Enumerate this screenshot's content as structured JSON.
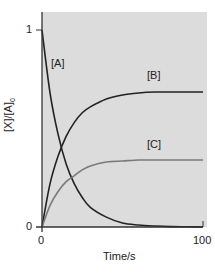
{
  "chart_data": {
    "type": "line",
    "title": "",
    "xlabel": "Time/s",
    "ylabel": "[X]/[A]0",
    "xlim": [
      0,
      100
    ],
    "ylim": [
      0,
      1.08
    ],
    "xticks": [
      "0",
      "100"
    ],
    "yticks": [
      "0",
      "1"
    ],
    "grid": false,
    "background": "#dcdcdc",
    "legend": "inline labels",
    "x": [
      0,
      5,
      10,
      15,
      20,
      25,
      30,
      40,
      50,
      60,
      70,
      80,
      90,
      100
    ],
    "series": [
      {
        "name": "[A]",
        "color": "#222222",
        "values": [
          1.0,
          0.68,
          0.47,
          0.32,
          0.22,
          0.15,
          0.1,
          0.05,
          0.02,
          0.01,
          0.005,
          0.002,
          0.001,
          0.0
        ]
      },
      {
        "name": "[B]",
        "color": "#222222",
        "values": [
          0.0,
          0.22,
          0.36,
          0.46,
          0.53,
          0.58,
          0.61,
          0.65,
          0.67,
          0.68,
          0.685,
          0.685,
          0.685,
          0.685
        ]
      },
      {
        "name": "[C]",
        "color": "#7a7a7a",
        "values": [
          0.0,
          0.11,
          0.18,
          0.23,
          0.26,
          0.29,
          0.31,
          0.33,
          0.335,
          0.34,
          0.34,
          0.34,
          0.34,
          0.34
        ]
      }
    ],
    "annotations": [
      "[A]",
      "[B]",
      "[C]"
    ]
  },
  "labels": {
    "x_axis": "Time/s",
    "y_axis_main": "[X]/[A]",
    "y_axis_sub": "0",
    "tick_x0": "0",
    "tick_x100": "100",
    "tick_y0": "0",
    "tick_y1": "1",
    "series_a": "[A]",
    "series_b": "[B]",
    "series_c": "[C]"
  }
}
